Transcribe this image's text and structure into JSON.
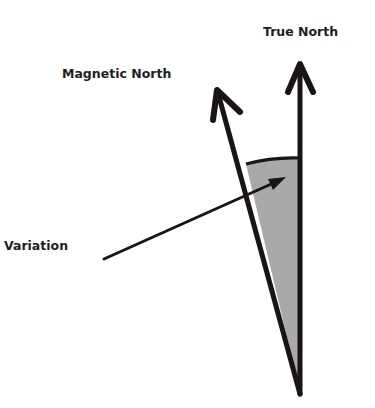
{
  "diagram": {
    "labels": {
      "true_north": "True North",
      "magnetic_north": "Magnetic North",
      "variation": "Variation"
    },
    "colors": {
      "line": "#1a1414",
      "fill": "#a9a9a9",
      "text": "#1e1e1e",
      "background": "#ffffff"
    }
  }
}
